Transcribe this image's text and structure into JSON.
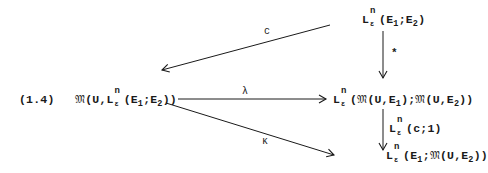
{
  "equation_number": "(1.4)",
  "nodes": {
    "top_right": {
      "L": "L",
      "sup": "n",
      "sub": "ε",
      "args_open": "(E",
      "a1": "1",
      "mid": ";E",
      "a2": "2",
      "close": ")"
    },
    "left": {
      "frak": "𝔐",
      "prefix": "(U,",
      "L": "L",
      "sup": "n",
      "sub": "ε",
      "args_open": "(E",
      "a1": "1",
      "mid": ";E",
      "a2": "2",
      "close": "))"
    },
    "middle_right": {
      "L": "L",
      "sup": "n",
      "sub": "ε",
      "open": "(",
      "frak1": "𝔐",
      "part1": "(U,E",
      "a1": "1",
      "sep": ");",
      "frak2": "𝔐",
      "part2": "(U,E",
      "a2": "2",
      "close": "))"
    },
    "bottom_right": {
      "L": "L",
      "sup": "n",
      "sub": "ε",
      "args_open": "(E",
      "a1": "1",
      "sep": ";",
      "frak": "𝔐",
      "part": "(U,E",
      "a2": "2",
      "close": "))"
    }
  },
  "arrows": {
    "c": {
      "label": "c"
    },
    "star": {
      "label": "*"
    },
    "lambda": {
      "label": "λ"
    },
    "kappa": {
      "label": "κ"
    },
    "lc1": {
      "L": "L",
      "sup": "n",
      "sub": "ε",
      "args": "(c;1)"
    }
  },
  "colors": {
    "ink": "#1a1a1a",
    "background": "#ffffff"
  }
}
